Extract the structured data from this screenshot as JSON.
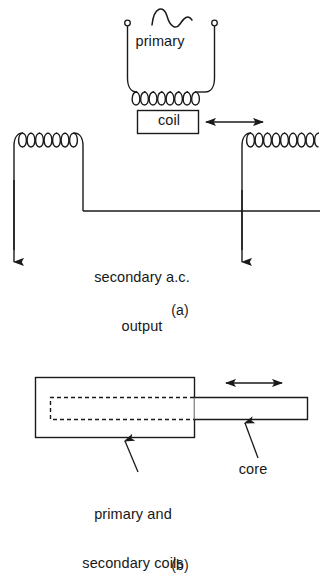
{
  "figure": {
    "ink_color": "#1a1a1a",
    "background_color": "#ffffff",
    "panels": [
      {
        "key": "a",
        "caption": "(a)",
        "description": "Circuit schematic of primary coil over movable core with two secondary coils"
      },
      {
        "key": "b",
        "caption": "(b)",
        "description": "Physical construction showing coil former and sliding core rod"
      }
    ]
  },
  "panel_a": {
    "primary_label": "primary",
    "coil_box_label": "coil",
    "secondary_label_line1": "secondary a.c.",
    "secondary_label_line2": "output",
    "caption": "(a)",
    "ac_source_symbol": "sine-wave",
    "terminals": 2,
    "primary_turns": 7,
    "secondary_left_turns": 6,
    "secondary_right_turns": 6,
    "motion_arrow": "double-headed-horizontal"
  },
  "panel_b": {
    "coils_label_line1": "primary and",
    "coils_label_line2": "secondary coils",
    "core_label": "core",
    "caption": "(b)",
    "motion_arrow": "double-headed-horizontal",
    "core_inside_style": "dashed",
    "core_outside_style": "solid"
  }
}
